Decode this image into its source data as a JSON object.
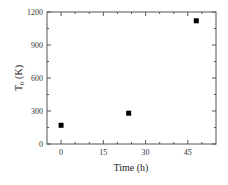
{
  "chart_data": {
    "type": "scatter",
    "title": "",
    "xlabel": "Time (h)",
    "ylabel_main": "T",
    "ylabel_sub": "0",
    "ylabel_unit": " (K)",
    "xlim": [
      -5,
      55
    ],
    "ylim": [
      0,
      1200
    ],
    "xticks": [
      0,
      15,
      30,
      45
    ],
    "xminor": [
      5,
      10,
      20,
      25,
      35,
      40,
      50
    ],
    "yticks": [
      0,
      300,
      600,
      900,
      1200
    ],
    "yminor": [
      150,
      450,
      750,
      1050
    ],
    "grid": false,
    "legend": null,
    "marker": "square",
    "marker_color": "#000000",
    "series": [
      {
        "name": "T0",
        "x": [
          0,
          24,
          48
        ],
        "y": [
          170,
          280,
          1120
        ]
      }
    ]
  }
}
